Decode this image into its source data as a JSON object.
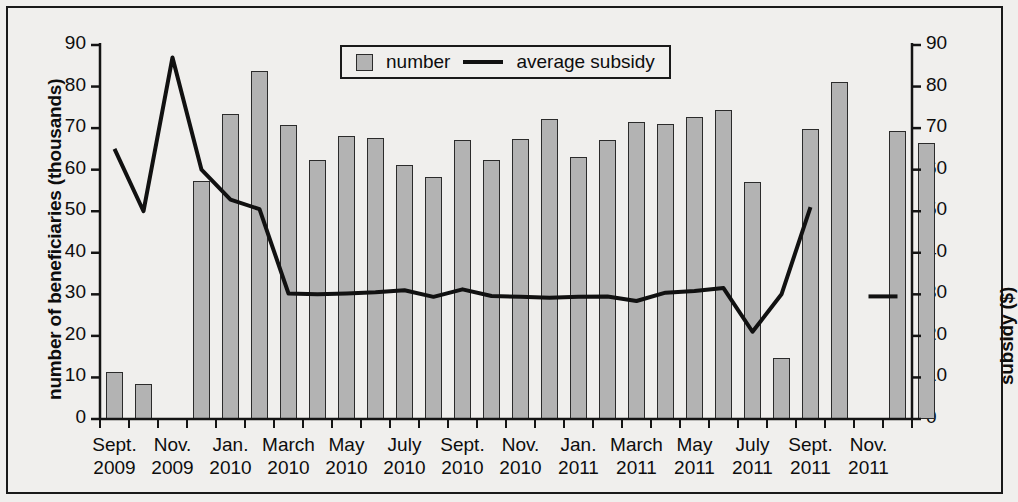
{
  "chart_data": {
    "type": "bar",
    "title": "",
    "xlabel": "",
    "ylabel": "number of beneficiaries (thousands)",
    "y2label": "subsidy ($)",
    "ylim": [
      0,
      90
    ],
    "y2lim": [
      0,
      90
    ],
    "grid": false,
    "legend_position": "top-center",
    "y_ticks": [
      0,
      10,
      20,
      30,
      40,
      50,
      60,
      70,
      80,
      90
    ],
    "y2_ticks": [
      0,
      10,
      20,
      30,
      40,
      50,
      60,
      70,
      80,
      90
    ],
    "categories": [
      "Sept. 2009",
      "Oct. 2009",
      "Nov. 2009",
      "Dec. 2009",
      "Jan. 2010",
      "Feb. 2010",
      "March 2010",
      "April 2010",
      "May 2010",
      "June 2010",
      "July 2010",
      "Aug. 2010",
      "Sept. 2010",
      "Oct. 2010",
      "Nov. 2010",
      "Dec. 2010",
      "Jan. 2011",
      "Feb. 2011",
      "March 2011",
      "April 2011",
      "May 2011",
      "June 2011",
      "July 2011",
      "Aug. 2011",
      "Sept. 2011",
      "Oct. 2011",
      "Nov. 2011",
      "Dec. 2011"
    ],
    "x_tick_labels": [
      {
        "index": 0,
        "line1": "Sept.",
        "line2": "2009"
      },
      {
        "index": 2,
        "line1": "Nov.",
        "line2": "2009"
      },
      {
        "index": 4,
        "line1": "Jan.",
        "line2": "2010"
      },
      {
        "index": 6,
        "line1": "March",
        "line2": "2010"
      },
      {
        "index": 8,
        "line1": "May",
        "line2": "2010"
      },
      {
        "index": 10,
        "line1": "July",
        "line2": "2010"
      },
      {
        "index": 12,
        "line1": "Sept.",
        "line2": "2010"
      },
      {
        "index": 14,
        "line1": "Nov.",
        "line2": "2010"
      },
      {
        "index": 16,
        "line1": "Jan.",
        "line2": "2011"
      },
      {
        "index": 18,
        "line1": "March",
        "line2": "2011"
      },
      {
        "index": 20,
        "line1": "May",
        "line2": "2011"
      },
      {
        "index": 22,
        "line1": "July",
        "line2": "2011"
      },
      {
        "index": 24,
        "line1": "Sept.",
        "line2": "2011"
      },
      {
        "index": 26,
        "line1": "Nov.",
        "line2": "2011"
      }
    ],
    "series": [
      {
        "name": "number",
        "kind": "bar",
        "axis": "left",
        "color": "#b3b3b3",
        "edge_color": "#2b2b2b",
        "values": [
          11.2,
          8.4,
          null,
          57.2,
          73.3,
          83.7,
          70.7,
          62.3,
          68.1,
          67.6,
          61.2,
          58.2,
          67.2,
          62.4,
          67.5,
          72.2,
          63.0,
          67.2,
          71.4,
          71.0,
          72.6,
          74.4,
          57.0,
          14.6,
          69.8,
          81.2,
          null,
          69.2
        ]
      },
      {
        "name": "average subsidy",
        "kind": "line",
        "axis": "right",
        "color": "#111111",
        "values": [
          65.0,
          50.0,
          87.0,
          60.0,
          52.8,
          50.5,
          30.2,
          30.0,
          30.2,
          30.5,
          31.0,
          29.4,
          31.2,
          29.6,
          29.4,
          29.2,
          29.4,
          29.5,
          28.4,
          30.4,
          30.8,
          31.5,
          21.0,
          30.0,
          51.0,
          null,
          29.5,
          29.5
        ]
      }
    ],
    "extra_bar": {
      "note": "final bar",
      "value": 66.4
    },
    "annotations": []
  },
  "legend": {
    "entries": [
      {
        "label": "number",
        "glyph": "swatch-icon"
      },
      {
        "label": "average subsidy",
        "glyph": "line-icon"
      }
    ]
  }
}
